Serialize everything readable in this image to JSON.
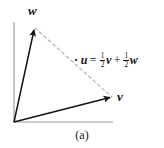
{
  "figure": {
    "caption": "(a)",
    "background_color": "#ffffff",
    "ink_color": "#151515",
    "dashed_color": "#b4b4b4"
  },
  "axes": {
    "origin": {
      "x": 14,
      "y": 122
    },
    "y_axis_top": {
      "x": 14,
      "y": 22
    },
    "x_axis_right": {
      "x": 113,
      "y": 122
    },
    "color": "#9a9a9a"
  },
  "vectors": [
    {
      "name": "w",
      "label": "w",
      "from": {
        "x": 14,
        "y": 122
      },
      "to": {
        "x": 34,
        "y": 27
      },
      "label_position": {
        "x": 28,
        "y": 4
      }
    },
    {
      "name": "v",
      "label": "v",
      "from": {
        "x": 14,
        "y": 122
      },
      "to": {
        "x": 113,
        "y": 97
      },
      "label_position": {
        "x": 117,
        "y": 90
      }
    }
  ],
  "midpoint_marker": {
    "name": "u",
    "point": {
      "x": 68,
      "y": 61
    },
    "radius": 2.4
  },
  "dashed_connector": {
    "from": {
      "x": 35,
      "y": 28
    },
    "to": {
      "x": 112,
      "y": 97
    },
    "dash_pattern": "3,3"
  },
  "equation": {
    "full_text": "u = 1/2 v + 1/2 w",
    "point_symbol": "•",
    "lhs": "u",
    "equals": "=",
    "term1": {
      "coefficient_numerator": "1",
      "coefficient_denominator": "2",
      "variable": "v"
    },
    "plus": "+",
    "term2": {
      "coefficient_numerator": "1",
      "coefficient_denominator": "2",
      "variable": "w"
    }
  }
}
